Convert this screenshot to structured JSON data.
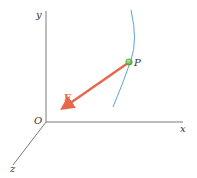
{
  "diagram": {
    "type": "3d-coordinate-force-vector",
    "axes": {
      "x_label": "x",
      "y_label": "y",
      "z_label": "z",
      "origin_label": "O"
    },
    "point": {
      "label": "P"
    },
    "force": {
      "label": "F"
    },
    "colors": {
      "axis": "#7a7a7a",
      "curve": "#5aa6d6",
      "force_arrow": "#e8674a",
      "point_fill": "#6cc04a",
      "labels": "#333333",
      "force_label": "#e8674a"
    }
  }
}
